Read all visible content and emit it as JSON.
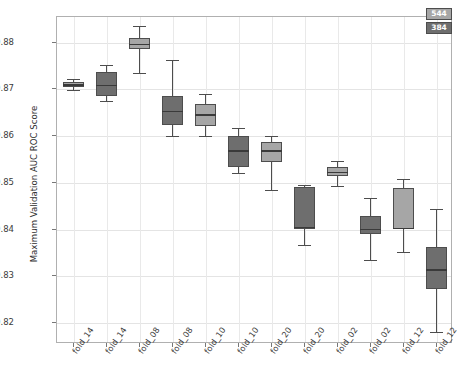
{
  "chart_data": {
    "type": "boxplot",
    "title": "",
    "xlabel": "",
    "ylabel": "Maximum Validation AUC ROC Score",
    "ylim": [
      0.8155,
      0.8855
    ],
    "yticks": [
      0.82,
      0.83,
      0.84,
      0.85,
      0.86,
      0.87,
      0.88
    ],
    "ytick_labels": [
      "0.82",
      "0.83",
      "0.84",
      "0.85",
      "0.86",
      "0.87",
      "0.88"
    ],
    "grid": true,
    "legend_position": "top-right",
    "legend": [
      {
        "label": "544",
        "color": "#a6a6a6"
      },
      {
        "label": "384",
        "color": "#6e6e6e"
      }
    ],
    "categories": [
      "fold_14",
      "fold_14",
      "fold_08",
      "fold_08",
      "fold_10",
      "fold_10",
      "fold_20",
      "fold_20",
      "fold_02",
      "fold_02",
      "fold_12",
      "fold_12"
    ],
    "boxes": [
      {
        "category": "fold_14",
        "series": "544",
        "whisker_low": 0.8698,
        "q1": 0.8706,
        "median": 0.8711,
        "q3": 0.8716,
        "whisker_high": 0.8722
      },
      {
        "category": "fold_14",
        "series": "384",
        "whisker_low": 0.8675,
        "q1": 0.8685,
        "median": 0.871,
        "q3": 0.8737,
        "whisker_high": 0.8753
      },
      {
        "category": "fold_08",
        "series": "544",
        "whisker_low": 0.8735,
        "q1": 0.8787,
        "median": 0.8798,
        "q3": 0.881,
        "whisker_high": 0.8836
      },
      {
        "category": "fold_08",
        "series": "384",
        "whisker_low": 0.8601,
        "q1": 0.8624,
        "median": 0.8654,
        "q3": 0.8686,
        "whisker_high": 0.8763
      },
      {
        "category": "fold_10",
        "series": "544",
        "whisker_low": 0.8601,
        "q1": 0.8622,
        "median": 0.8647,
        "q3": 0.8668,
        "whisker_high": 0.8691
      },
      {
        "category": "fold_10",
        "series": "384",
        "whisker_low": 0.852,
        "q1": 0.8533,
        "median": 0.857,
        "q3": 0.8601,
        "whisker_high": 0.8618
      },
      {
        "category": "fold_20",
        "series": "544",
        "whisker_low": 0.8485,
        "q1": 0.8545,
        "median": 0.857,
        "q3": 0.8588,
        "whisker_high": 0.86
      },
      {
        "category": "fold_20",
        "series": "384",
        "whisker_low": 0.8366,
        "q1": 0.8402,
        "median": 0.8406,
        "q3": 0.8491,
        "whisker_high": 0.8495
      },
      {
        "category": "fold_02",
        "series": "544",
        "whisker_low": 0.8493,
        "q1": 0.8515,
        "median": 0.8524,
        "q3": 0.8533,
        "whisker_high": 0.8546
      },
      {
        "category": "fold_02",
        "series": "384",
        "whisker_low": 0.8335,
        "q1": 0.839,
        "median": 0.8402,
        "q3": 0.843,
        "whisker_high": 0.8468
      },
      {
        "category": "fold_12",
        "series": "544",
        "whisker_low": 0.8352,
        "q1": 0.8402,
        "median": 0.8404,
        "q3": 0.849,
        "whisker_high": 0.8508
      },
      {
        "category": "fold_12",
        "series": "384",
        "whisker_low": 0.818,
        "q1": 0.8272,
        "median": 0.8315,
        "q3": 0.8363,
        "whisker_high": 0.8443
      }
    ]
  }
}
